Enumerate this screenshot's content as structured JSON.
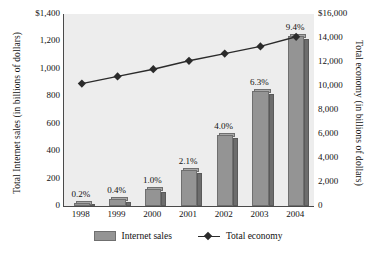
{
  "chart_data": {
    "type": "bar",
    "title": "",
    "categories": [
      "1998",
      "1999",
      "2000",
      "2001",
      "2002",
      "2003",
      "2004"
    ],
    "grid": false,
    "legend_position": "bottom",
    "series": [
      {
        "name": "Internet sales",
        "type": "bar",
        "axis": "left",
        "values": [
          24,
          48,
          125,
          265,
          515,
          840,
          1240
        ],
        "data_labels": [
          "0.2%",
          "0.4%",
          "1.0%",
          "2.1%",
          "4.0%",
          "6.3%",
          "9.4%"
        ],
        "color": "#949494"
      },
      {
        "name": "Total economy",
        "type": "line",
        "axis": "right",
        "values": [
          10200,
          10800,
          11400,
          12100,
          12700,
          13300,
          14100
        ],
        "color": "#2b2b2b",
        "marker": "diamond"
      }
    ],
    "xlabel": "",
    "ylabel": "Total Internet sales (in billions of dollars)",
    "y2label": "Total economy (in billions of dollars)",
    "ylim": [
      0,
      1400
    ],
    "y2lim": [
      0,
      16000
    ],
    "yticks": [
      "0",
      "200",
      "400",
      "600",
      "800",
      "1,000",
      "1,200",
      "$1,400"
    ],
    "ytick_values": [
      0,
      200,
      400,
      600,
      800,
      1000,
      1200,
      1400
    ],
    "y2ticks": [
      "0",
      "2,000",
      "4,000",
      "6,000",
      "8,000",
      "10,000",
      "12,000",
      "14,000",
      "$16,000"
    ],
    "y2tick_values": [
      0,
      2000,
      4000,
      6000,
      8000,
      10000,
      12000,
      14000,
      16000
    ]
  },
  "axes": {
    "left_title": "Total Internet sales (in billions of dollars)",
    "right_title": "Total economy (in billions of dollars)"
  },
  "legend": {
    "items": [
      {
        "label": "Internet sales"
      },
      {
        "label": "Total economy"
      }
    ]
  },
  "colors": {
    "bar_face": "#949494",
    "bar_side": "#6d6d6d",
    "line": "#2b2b2b",
    "plot_background": "#ededed",
    "axis": "#4a4a4a"
  }
}
